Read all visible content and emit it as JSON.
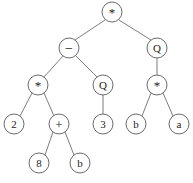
{
  "figure": {
    "kind": "expression-tree",
    "width": 193,
    "height": 183,
    "background_color": "#ffffff",
    "edge_color": "#6e6e6e",
    "node_stroke_color": "#5a5a5a",
    "node_fill_color": "#ffffff",
    "label_color": "#1c1c1c",
    "node_radius": 10
  },
  "nodes": [
    {
      "id": "n0",
      "label": "*",
      "kind": "operator",
      "cx": 112,
      "cy": 12,
      "r": 10
    },
    {
      "id": "n1",
      "label": "−",
      "kind": "operator",
      "cx": 69,
      "cy": 48,
      "r": 10
    },
    {
      "id": "n2",
      "label": "Q",
      "kind": "operator",
      "cx": 157,
      "cy": 48,
      "r": 10
    },
    {
      "id": "n3",
      "label": "*",
      "kind": "operator",
      "cx": 38,
      "cy": 85,
      "r": 10
    },
    {
      "id": "n4",
      "label": "Q",
      "kind": "operator",
      "cx": 103,
      "cy": 85,
      "r": 10
    },
    {
      "id": "n5",
      "label": "*",
      "kind": "operator",
      "cx": 157,
      "cy": 85,
      "r": 10
    },
    {
      "id": "n6",
      "label": "2",
      "kind": "leaf",
      "cx": 14,
      "cy": 124,
      "r": 10
    },
    {
      "id": "n7",
      "label": "+",
      "kind": "operator",
      "cx": 59,
      "cy": 124,
      "r": 10
    },
    {
      "id": "n8",
      "label": "3",
      "kind": "leaf",
      "cx": 103,
      "cy": 124,
      "r": 10
    },
    {
      "id": "n9",
      "label": "b",
      "kind": "leaf",
      "cx": 136,
      "cy": 124,
      "r": 10
    },
    {
      "id": "n10",
      "label": "a",
      "kind": "leaf",
      "cx": 179,
      "cy": 124,
      "r": 10
    },
    {
      "id": "n11",
      "label": "8",
      "kind": "leaf",
      "cx": 39,
      "cy": 163,
      "r": 10
    },
    {
      "id": "n12",
      "label": "b",
      "kind": "leaf",
      "cx": 80,
      "cy": 163,
      "r": 10
    }
  ],
  "edges": [
    {
      "from": "n0",
      "to": "n1",
      "x1": 105,
      "y1": 20,
      "x2": 75,
      "y2": 40
    },
    {
      "from": "n0",
      "to": "n2",
      "x1": 119,
      "y1": 20,
      "x2": 151,
      "y2": 40
    },
    {
      "from": "n1",
      "to": "n3",
      "x1": 63,
      "y1": 56,
      "x2": 44,
      "y2": 77
    },
    {
      "from": "n1",
      "to": "n4",
      "x1": 76,
      "y1": 56,
      "x2": 97,
      "y2": 77
    },
    {
      "from": "n2",
      "to": "n5",
      "x1": 157,
      "y1": 58,
      "x2": 157,
      "y2": 75
    },
    {
      "from": "n3",
      "to": "n6",
      "x1": 32,
      "y1": 93,
      "x2": 20,
      "y2": 116
    },
    {
      "from": "n3",
      "to": "n7",
      "x1": 44,
      "y1": 93,
      "x2": 54,
      "y2": 116
    },
    {
      "from": "n4",
      "to": "n8",
      "x1": 103,
      "y1": 95,
      "x2": 103,
      "y2": 114
    },
    {
      "from": "n5",
      "to": "n9",
      "x1": 151,
      "y1": 93,
      "x2": 142,
      "y2": 116
    },
    {
      "from": "n5",
      "to": "n10",
      "x1": 163,
      "y1": 93,
      "x2": 173,
      "y2": 116
    },
    {
      "from": "n7",
      "to": "n11",
      "x1": 53,
      "y1": 132,
      "x2": 45,
      "y2": 155
    },
    {
      "from": "n7",
      "to": "n12",
      "x1": 65,
      "y1": 132,
      "x2": 74,
      "y2": 155
    }
  ]
}
